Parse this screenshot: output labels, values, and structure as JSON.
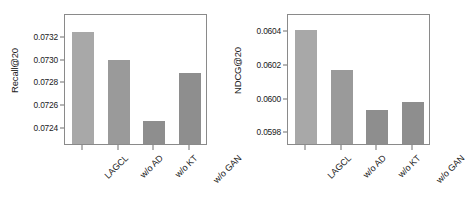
{
  "figure": {
    "background": "#ffffff",
    "panel_count": 2
  },
  "chart_data": [
    {
      "type": "bar",
      "title": "",
      "xlabel": "",
      "ylabel": "Recall@20",
      "categories": [
        "LAGCL",
        "w/o AD",
        "w/o KT",
        "w/o GAN"
      ],
      "values": [
        0.07323,
        0.07299,
        0.07245,
        0.07287
      ],
      "ylim": [
        0.07225,
        0.0734
      ],
      "yticks": [
        0.0724,
        0.0726,
        0.0728,
        0.073,
        0.0732
      ],
      "ytick_labels": [
        "0.0724",
        "0.0726",
        "0.0728",
        "0.0730",
        "0.0732"
      ],
      "bar_colors": [
        "#a8a8a8",
        "#9a9a9a",
        "#8e8e8e",
        "#8e8e8e"
      ],
      "grid": false,
      "legend": "none"
    },
    {
      "type": "bar",
      "title": "",
      "xlabel": "",
      "ylabel": "NDCG@20",
      "categories": [
        "LAGCL",
        "w/o AD",
        "w/o KT",
        "w/o GAN"
      ],
      "values": [
        0.0604,
        0.060165,
        0.059925,
        0.059975
      ],
      "ylim": [
        0.059725,
        0.0605
      ],
      "yticks": [
        0.0598,
        0.06,
        0.0602,
        0.0604
      ],
      "ytick_labels": [
        "0.0598",
        "0.0600",
        "0.0602",
        "0.0604"
      ],
      "bar_colors": [
        "#a8a8a8",
        "#9a9a9a",
        "#8e8e8e",
        "#8e8e8e"
      ],
      "grid": false,
      "legend": "none"
    }
  ]
}
